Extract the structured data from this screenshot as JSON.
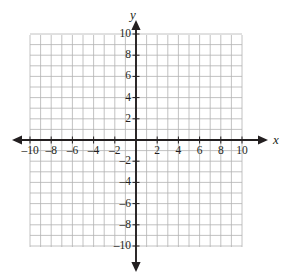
{
  "figure": {
    "title": "",
    "axis_labels": {
      "x": "x",
      "y": "y"
    },
    "background_color": "#ffffff",
    "grid_color": "#b3b3b3",
    "axis_color": "#231f20",
    "label_color": "#231f20"
  },
  "chart_data": {
    "type": "scatter",
    "title": "",
    "xlabel": "x",
    "ylabel": "y",
    "xlim": [
      -10,
      10
    ],
    "ylim": [
      -10,
      10
    ],
    "grid": true,
    "grid_step": 1,
    "tick_step": 2,
    "legend": null,
    "series": [],
    "points": [],
    "annotations": [],
    "xticks": [
      -10,
      -8,
      -6,
      -4,
      -2,
      2,
      4,
      6,
      8,
      10
    ],
    "yticks": [
      -10,
      -8,
      -6,
      -4,
      -2,
      2,
      4,
      6,
      8,
      10
    ],
    "xtick_labels": [
      "–10",
      "–8",
      "–6",
      "–4",
      "–2",
      "2",
      "4",
      "6",
      "8",
      "10"
    ],
    "ytick_labels": [
      "–10",
      "–8",
      "–6",
      "–4",
      "–2",
      "2",
      "4",
      "6",
      "8",
      "10"
    ],
    "origin_label": ""
  },
  "geometry": {
    "origin_px": {
      "x": 136,
      "y": 140
    },
    "unit_px": 10.6,
    "grid_bounds_px": {
      "left": 30,
      "right": 242,
      "top": 35,
      "bottom": 247
    },
    "x_axis_arrow_left_px": 12,
    "x_axis_arrow_right_px": 268,
    "y_axis_arrow_top_px": 20,
    "y_axis_arrow_bottom_px": 272
  }
}
